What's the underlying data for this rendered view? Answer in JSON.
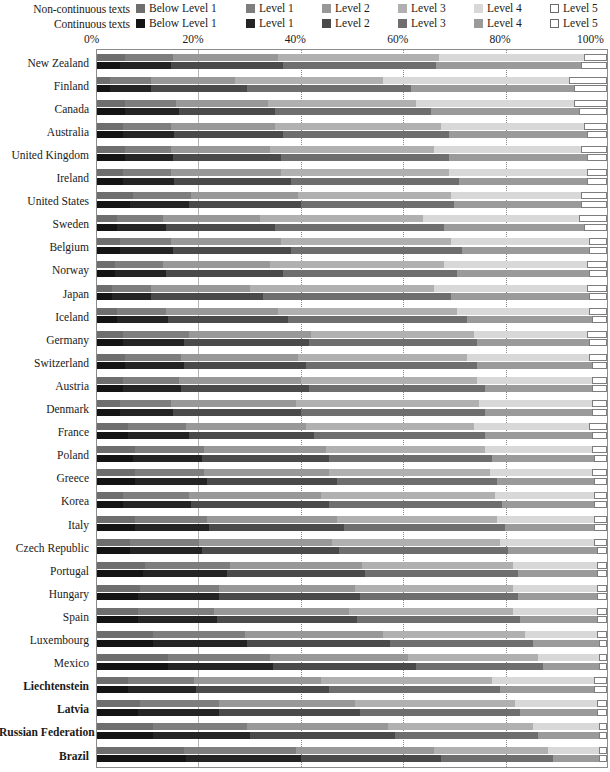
{
  "chart_data": {
    "type": "bar",
    "title": "",
    "xlabel": "",
    "ylabel": "",
    "orientation": "horizontal",
    "stacked": true,
    "normalized": true,
    "xlim": [
      0,
      100
    ],
    "x_ticks": [
      "0%",
      "20%",
      "40%",
      "60%",
      "80%",
      "100%"
    ],
    "x_tick_values": [
      0,
      20,
      40,
      60,
      80,
      100
    ],
    "grid": "vertical-dotted",
    "legend_position": "top",
    "legend": {
      "rows": [
        {
          "title": "Non-continuous texts",
          "key": "non_continuous",
          "entries": [
            {
              "label": "Below Level  1",
              "color": "#6e6e6e"
            },
            {
              "label": "Level 1",
              "color": "#7e7e7e"
            },
            {
              "label": "Level 2",
              "color": "#989898"
            },
            {
              "label": "Level 3",
              "color": "#b0b0b0"
            },
            {
              "label": "Level 4",
              "color": "#d8d8d8"
            },
            {
              "label": "Level 5",
              "color": "#ffffff"
            }
          ]
        },
        {
          "title": "Continuous texts",
          "key": "continuous",
          "entries": [
            {
              "label": "Below Level  1",
              "color": "#141414"
            },
            {
              "label": "Level 1",
              "color": "#242424"
            },
            {
              "label": "Level 2",
              "color": "#4a4a4a"
            },
            {
              "label": "Level 3",
              "color": "#6e6e6e"
            },
            {
              "label": "Level 4",
              "color": "#9a9a9a"
            },
            {
              "label": "Level 5",
              "color": "#ffffff"
            }
          ]
        }
      ]
    },
    "categories": [
      "New Zealand",
      "Finland",
      "Canada",
      "Australia",
      "United Kingdom",
      "Ireland",
      "United States",
      "Sweden",
      "Belgium",
      "Norway",
      "Japan",
      "Iceland",
      "Germany",
      "Switzerland",
      "Austria",
      "Denmark",
      "France",
      "Poland",
      "Greece",
      "Korea",
      "Italy",
      "Czech Republic",
      "Portugal",
      "Hungary",
      "Spain",
      "Luxembourg",
      "Mexico",
      "Liechtenstein",
      "Latvia",
      "Russian Federation",
      "Brazil"
    ],
    "bold_categories": [
      "Liechtenstein",
      "Latvia",
      "Russian Federation",
      "Brazil"
    ],
    "series_levels": [
      "Below Level 1",
      "Level 1",
      "Level 2",
      "Level 3",
      "Level 4",
      "Level 5"
    ],
    "rows": [
      {
        "category": "New Zealand",
        "non_continuous": [
          5.5,
          9.5,
          20.5,
          31.5,
          28.5,
          4.5
        ],
        "continuous": [
          4.5,
          10.0,
          22.0,
          30.0,
          28.5,
          5.0
        ]
      },
      {
        "category": "Finland",
        "non_continuous": [
          2.5,
          8.0,
          16.5,
          29.0,
          36.5,
          7.5
        ],
        "continuous": [
          2.5,
          8.0,
          19.0,
          32.0,
          32.0,
          6.5
        ]
      },
      {
        "category": "Canada",
        "non_continuous": [
          5.5,
          10.0,
          18.0,
          29.0,
          31.0,
          6.5
        ],
        "continuous": [
          5.5,
          10.5,
          19.0,
          30.5,
          29.0,
          5.5
        ]
      },
      {
        "category": "Australia",
        "non_continuous": [
          5.0,
          9.5,
          20.5,
          32.5,
          28.0,
          4.5
        ],
        "continuous": [
          5.0,
          10.0,
          21.5,
          32.5,
          27.0,
          4.0
        ]
      },
      {
        "category": "United Kingdom",
        "non_continuous": [
          5.5,
          9.0,
          19.5,
          32.0,
          29.0,
          5.0
        ],
        "continuous": [
          5.5,
          9.5,
          21.0,
          33.0,
          27.0,
          4.0
        ]
      },
      {
        "category": "Ireland",
        "non_continuous": [
          5.0,
          9.5,
          21.5,
          33.0,
          27.0,
          4.0
        ],
        "continuous": [
          5.0,
          10.0,
          23.0,
          33.0,
          25.0,
          4.0
        ]
      },
      {
        "category": "United States",
        "non_continuous": [
          7.0,
          11.5,
          21.0,
          30.0,
          25.5,
          5.0
        ],
        "continuous": [
          6.5,
          11.5,
          22.0,
          30.0,
          25.0,
          5.0
        ]
      },
      {
        "category": "Sweden",
        "non_continuous": [
          4.0,
          9.0,
          19.0,
          32.0,
          30.5,
          5.5
        ],
        "continuous": [
          4.0,
          9.5,
          21.5,
          33.0,
          27.5,
          4.5
        ]
      },
      {
        "category": "Belgium",
        "non_continuous": [
          4.5,
          10.0,
          21.5,
          33.5,
          27.0,
          3.5
        ],
        "continuous": [
          4.5,
          10.5,
          23.0,
          33.5,
          25.0,
          3.5
        ]
      },
      {
        "category": "Norway",
        "non_continuous": [
          3.5,
          9.5,
          21.0,
          34.0,
          28.0,
          4.0
        ],
        "continuous": [
          3.5,
          10.0,
          23.0,
          34.0,
          26.0,
          3.5
        ]
      },
      {
        "category": "Japan",
        "non_continuous": [
          3.0,
          7.5,
          19.5,
          36.0,
          30.0,
          4.0
        ],
        "continuous": [
          3.0,
          7.5,
          22.0,
          37.0,
          27.0,
          3.5
        ]
      },
      {
        "category": "Iceland",
        "non_continuous": [
          4.0,
          9.5,
          22.0,
          35.0,
          26.0,
          3.5
        ],
        "continuous": [
          4.0,
          10.0,
          23.5,
          35.0,
          24.5,
          3.0
        ]
      },
      {
        "category": "Germany",
        "non_continuous": [
          5.0,
          13.0,
          24.0,
          32.0,
          22.0,
          4.0
        ],
        "continuous": [
          5.0,
          12.0,
          24.5,
          33.0,
          22.0,
          3.5
        ]
      },
      {
        "category": "Switzerland",
        "non_continuous": [
          5.5,
          11.0,
          23.0,
          33.0,
          24.0,
          3.5
        ],
        "continuous": [
          5.5,
          11.5,
          24.0,
          33.5,
          22.5,
          3.0
        ]
      },
      {
        "category": "Austria",
        "non_continuous": [
          5.0,
          11.0,
          24.0,
          34.5,
          22.5,
          3.0
        ],
        "continuous": [
          5.0,
          11.5,
          25.0,
          34.5,
          21.0,
          3.0
        ]
      },
      {
        "category": "Denmark",
        "non_continuous": [
          4.5,
          10.0,
          24.5,
          36.0,
          22.0,
          3.0
        ],
        "continuous": [
          4.5,
          10.5,
          25.0,
          36.0,
          21.0,
          3.0
        ]
      },
      {
        "category": "France",
        "non_continuous": [
          6.0,
          11.5,
          23.5,
          33.0,
          22.5,
          3.5
        ],
        "continuous": [
          6.0,
          12.0,
          24.5,
          33.5,
          21.0,
          3.0
        ]
      },
      {
        "category": "Poland",
        "non_continuous": [
          7.5,
          13.5,
          24.0,
          31.0,
          21.0,
          3.0
        ],
        "continuous": [
          7.0,
          13.5,
          25.0,
          32.0,
          20.0,
          2.5
        ]
      },
      {
        "category": "Greece",
        "non_continuous": [
          7.5,
          13.5,
          24.5,
          31.5,
          20.0,
          3.0
        ],
        "continuous": [
          7.5,
          14.0,
          25.5,
          31.5,
          19.0,
          2.5
        ]
      },
      {
        "category": "Korea",
        "non_continuous": [
          5.0,
          13.0,
          26.0,
          34.0,
          19.5,
          2.5
        ],
        "continuous": [
          5.0,
          13.5,
          27.0,
          34.0,
          18.0,
          2.5
        ]
      },
      {
        "category": "Italy",
        "non_continuous": [
          7.5,
          14.0,
          25.5,
          31.5,
          19.0,
          2.5
        ],
        "continuous": [
          7.5,
          14.5,
          26.5,
          31.5,
          17.5,
          2.5
        ]
      },
      {
        "category": "Czech Republic",
        "non_continuous": [
          6.5,
          13.5,
          26.0,
          33.0,
          18.5,
          2.5
        ],
        "continuous": [
          6.5,
          14.0,
          27.0,
          33.0,
          17.5,
          2.0
        ]
      },
      {
        "category": "Portugal",
        "non_continuous": [
          9.5,
          16.5,
          26.0,
          29.5,
          16.5,
          2.0
        ],
        "continuous": [
          9.0,
          16.5,
          27.0,
          30.0,
          15.5,
          2.0
        ]
      },
      {
        "category": "Hungary",
        "non_continuous": [
          8.5,
          15.5,
          26.5,
          31.0,
          16.5,
          2.0
        ],
        "continuous": [
          8.0,
          16.0,
          27.5,
          31.0,
          15.5,
          2.0
        ]
      },
      {
        "category": "Spain",
        "non_continuous": [
          8.0,
          15.0,
          26.5,
          32.0,
          16.5,
          2.0
        ],
        "continuous": [
          8.0,
          15.5,
          27.5,
          32.0,
          15.0,
          2.0
        ]
      },
      {
        "category": "Luxembourg",
        "non_continuous": [
          11.0,
          18.0,
          27.0,
          28.0,
          14.0,
          2.0
        ],
        "continuous": [
          11.0,
          18.5,
          28.0,
          28.0,
          13.0,
          1.5
        ]
      },
      {
        "category": "Mexico",
        "non_continuous": [
          14.0,
          20.0,
          27.0,
          25.5,
          12.0,
          1.5
        ],
        "continuous": [
          14.0,
          20.5,
          28.0,
          25.0,
          11.0,
          1.5
        ]
      },
      {
        "category": "Liechtenstein",
        "non_continuous": [
          6.0,
          13.0,
          25.0,
          33.5,
          20.0,
          2.5
        ],
        "continuous": [
          6.0,
          13.5,
          26.0,
          33.5,
          18.5,
          2.5
        ]
      },
      {
        "category": "Latvia",
        "non_continuous": [
          8.5,
          15.5,
          26.5,
          31.5,
          16.0,
          2.0
        ],
        "continuous": [
          8.0,
          16.0,
          27.5,
          31.5,
          15.0,
          2.0
        ]
      },
      {
        "category": "Russian Federation",
        "non_continuous": [
          11.0,
          18.5,
          27.5,
          28.5,
          13.0,
          1.5
        ],
        "continuous": [
          11.0,
          19.0,
          28.5,
          28.0,
          12.0,
          1.5
        ]
      },
      {
        "category": "Brazil",
        "non_continuous": [
          17.0,
          22.0,
          27.0,
          22.5,
          10.0,
          1.5
        ],
        "continuous": [
          17.5,
          22.5,
          27.5,
          22.0,
          9.0,
          1.5
        ]
      }
    ]
  }
}
